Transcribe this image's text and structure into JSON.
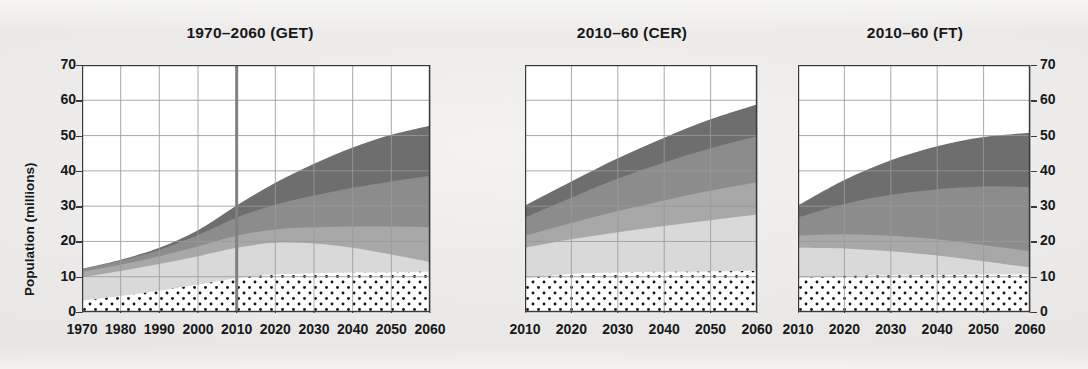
{
  "figure": {
    "background": "#eeecea",
    "ylabel": "Population (millions)",
    "y_axis": {
      "min": 0,
      "max": 70,
      "ticks": [
        0,
        10,
        20,
        30,
        40,
        50,
        60,
        70
      ],
      "tick_labels": [
        "0",
        "10",
        "20",
        "30",
        "40",
        "50",
        "60",
        "70"
      ]
    },
    "colors": {
      "layer_dotted_fill": "#ffffff",
      "layer_dotted_dots": "#141414",
      "layer_light": "#d9d9d9",
      "layer_mid": "#a8a8a8",
      "layer_dark": "#8c8c8c",
      "layer_darkest": "#6e6e6e",
      "axis": "#3a3a3a",
      "grid": "#9a9a9a",
      "marker_line": "#808080"
    }
  },
  "chart_data": [
    {
      "type": "area",
      "title": "1970–2060 (GET)",
      "xlabel": "",
      "ylabel": "Population (millions)",
      "xlim": [
        1970,
        2060
      ],
      "ylim": [
        0,
        70
      ],
      "grid": true,
      "legend": "none",
      "x": [
        1970,
        1980,
        1990,
        2000,
        2010,
        2020,
        2030,
        2040,
        2050,
        2060
      ],
      "x_tick_labels": [
        "1970",
        "1980",
        "1990",
        "2000",
        "2010",
        "2020",
        "2030",
        "2040",
        "2050",
        "2060"
      ],
      "annotation_vline": 2010,
      "series": [
        {
          "name": "layer-1-dotted",
          "style": "dotted",
          "values": [
            3.2,
            4.5,
            6.0,
            7.8,
            9.6,
            10.6,
            11.0,
            11.2,
            11.3,
            11.4
          ]
        },
        {
          "name": "layer-2-light",
          "style": "light",
          "values": [
            9.8,
            11.6,
            13.6,
            15.8,
            18.2,
            19.6,
            19.4,
            18.2,
            16.3,
            14.2
          ]
        },
        {
          "name": "layer-3-mid",
          "style": "mid",
          "values": [
            11.4,
            13.4,
            15.8,
            18.6,
            21.6,
            23.4,
            24.0,
            24.2,
            24.2,
            24.0
          ]
        },
        {
          "name": "layer-4-dark",
          "style": "dark",
          "values": [
            12.2,
            14.6,
            17.6,
            21.8,
            26.8,
            30.4,
            33.0,
            35.2,
            37.0,
            38.6
          ]
        },
        {
          "name": "layer-5-darkest",
          "style": "darkest",
          "values": [
            12.2,
            14.8,
            18.2,
            23.2,
            30.2,
            36.6,
            42.0,
            46.6,
            50.2,
            52.8
          ]
        }
      ]
    },
    {
      "type": "area",
      "title": "2010–60 (CER)",
      "xlabel": "",
      "ylabel": "",
      "xlim": [
        2010,
        2060
      ],
      "ylim": [
        0,
        70
      ],
      "grid": true,
      "legend": "none",
      "x": [
        2010,
        2020,
        2030,
        2040,
        2050,
        2060
      ],
      "x_tick_labels": [
        "2010",
        "2020",
        "2030",
        "2040",
        "2050",
        "2060"
      ],
      "annotation_vline": null,
      "series": [
        {
          "name": "layer-1-dotted",
          "style": "dotted",
          "values": [
            9.6,
            10.8,
            11.2,
            11.4,
            11.5,
            11.6
          ]
        },
        {
          "name": "layer-2-light",
          "style": "light",
          "values": [
            18.2,
            20.6,
            22.6,
            24.4,
            26.0,
            27.6
          ]
        },
        {
          "name": "layer-3-mid",
          "style": "mid",
          "values": [
            21.6,
            25.2,
            28.6,
            31.6,
            34.4,
            36.8
          ]
        },
        {
          "name": "layer-4-dark",
          "style": "dark",
          "values": [
            26.8,
            32.4,
            37.8,
            42.4,
            46.4,
            49.8
          ]
        },
        {
          "name": "layer-5-darkest",
          "style": "darkest",
          "values": [
            30.2,
            37.0,
            43.6,
            49.4,
            54.6,
            58.8
          ]
        }
      ]
    },
    {
      "type": "area",
      "title": "2010–60 (FT)",
      "xlabel": "",
      "ylabel": "",
      "xlim": [
        2010,
        2060
      ],
      "ylim": [
        0,
        70
      ],
      "grid": true,
      "legend": "none",
      "x": [
        2010,
        2020,
        2030,
        2040,
        2050,
        2060
      ],
      "x_tick_labels": [
        "2010",
        "2020",
        "2030",
        "2040",
        "2050",
        "2060"
      ],
      "annotation_vline": null,
      "series": [
        {
          "name": "layer-1-dotted",
          "style": "dotted",
          "values": [
            9.6,
            10.2,
            10.4,
            10.5,
            10.6,
            10.6
          ]
        },
        {
          "name": "layer-2-light",
          "style": "light",
          "values": [
            18.2,
            18.0,
            17.2,
            16.0,
            14.4,
            12.6
          ]
        },
        {
          "name": "layer-3-mid",
          "style": "mid",
          "values": [
            21.6,
            22.0,
            21.6,
            20.6,
            19.0,
            17.2
          ]
        },
        {
          "name": "layer-4-dark",
          "style": "dark",
          "values": [
            26.8,
            30.6,
            33.2,
            34.8,
            35.6,
            35.4
          ]
        },
        {
          "name": "layer-5-darkest",
          "style": "darkest",
          "values": [
            30.2,
            37.4,
            43.0,
            47.0,
            49.6,
            50.8
          ]
        }
      ]
    }
  ],
  "panels": [
    {
      "id": "panel-get",
      "title_key": 0
    },
    {
      "id": "panel-cer",
      "title_key": 1
    },
    {
      "id": "panel-ft",
      "title_key": 2
    }
  ]
}
